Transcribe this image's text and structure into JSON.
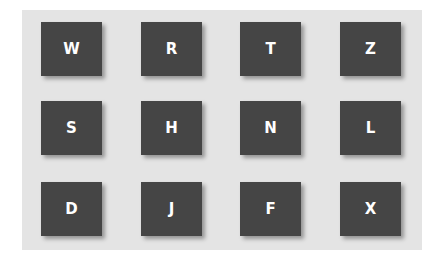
{
  "grid": {
    "rows": [
      [
        "W",
        "R",
        "T",
        "Z"
      ],
      [
        "S",
        "H",
        "N",
        "L"
      ],
      [
        "D",
        "J",
        "F",
        "X"
      ]
    ]
  },
  "colors": {
    "background": "#e4e4e4",
    "tile": "#454545",
    "letter": "#ffffff"
  }
}
